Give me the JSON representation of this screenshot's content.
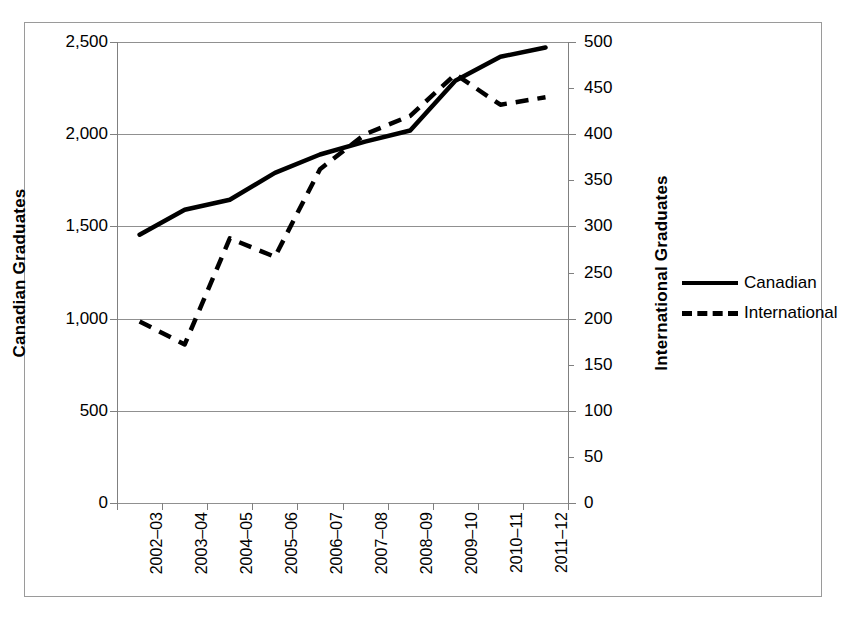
{
  "chart_data": {
    "type": "line",
    "title": "",
    "xlabel": "",
    "ylabel": "Canadian Graduates",
    "y2label": "International Graduates",
    "categories": [
      "2002–03",
      "2003–04",
      "2004–05",
      "2005–06",
      "2006–07",
      "2007–08",
      "2008–09",
      "2009–10",
      "2010–11",
      "2011–12"
    ],
    "ylim": [
      0,
      2500
    ],
    "y2lim": [
      0,
      500
    ],
    "yticks": [
      "0",
      "500",
      "1,000",
      "1,500",
      "2,000",
      "2,500"
    ],
    "ytick_values": [
      0,
      500,
      1000,
      1500,
      2000,
      2500
    ],
    "y2ticks": [
      "0",
      "50",
      "100",
      "150",
      "200",
      "250",
      "300",
      "350",
      "400",
      "450",
      "500"
    ],
    "y2tick_values": [
      0,
      50,
      100,
      150,
      200,
      250,
      300,
      350,
      400,
      450,
      500
    ],
    "grid": true,
    "grid_axis": "y-left",
    "legend_position": "right",
    "series": [
      {
        "name": "Canadian",
        "axis": "left",
        "style": "solid",
        "color": "#000000",
        "values": [
          1455,
          1590,
          1645,
          1790,
          1890,
          1960,
          2020,
          2290,
          2420,
          2470
        ]
      },
      {
        "name": "International",
        "axis": "right",
        "style": "dashed",
        "color": "#000000",
        "values": [
          197,
          172,
          287,
          267,
          362,
          400,
          420,
          465,
          432,
          440
        ]
      }
    ]
  },
  "legend": {
    "items": [
      {
        "label": "Canadian",
        "style": "solid"
      },
      {
        "label": "International",
        "style": "dashed"
      }
    ]
  },
  "axes": {
    "left_title": "Canadian Graduates",
    "right_title": "International Graduates"
  }
}
